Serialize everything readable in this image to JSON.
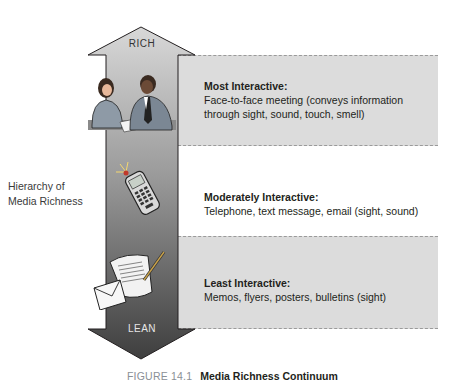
{
  "diagram": {
    "arrow": {
      "top_label": "RICH",
      "bottom_label": "LEAN",
      "gradient_top": "#d4d4d4",
      "gradient_bottom": "#4a4a4a"
    },
    "side_label": {
      "line1": "Hierarchy of",
      "line2": "Media Richness"
    },
    "levels": [
      {
        "title": "Most Interactive:",
        "desc_line1": "Face-to-face meeting (conveys information",
        "desc_line2": "through sight, sound, touch, smell)",
        "icon": "people-meeting-icon",
        "shaded": true
      },
      {
        "title": "Moderately Interactive:",
        "desc_line1": "Telephone, text message, email (sight, sound)",
        "desc_line2": "",
        "icon": "mobile-phone-icon",
        "shaded": false
      },
      {
        "title": "Least Interactive:",
        "desc_line1": "Memos, flyers, posters, bulletins (sight)",
        "desc_line2": "",
        "icon": "memo-envelope-icon",
        "shaded": true
      }
    ],
    "colors": {
      "band_shade": "#dcdcdc",
      "dash": "#9a9a9a"
    }
  },
  "caption": {
    "figure_number": "FIGURE 14.1",
    "title": "Media Richness Continuum"
  }
}
